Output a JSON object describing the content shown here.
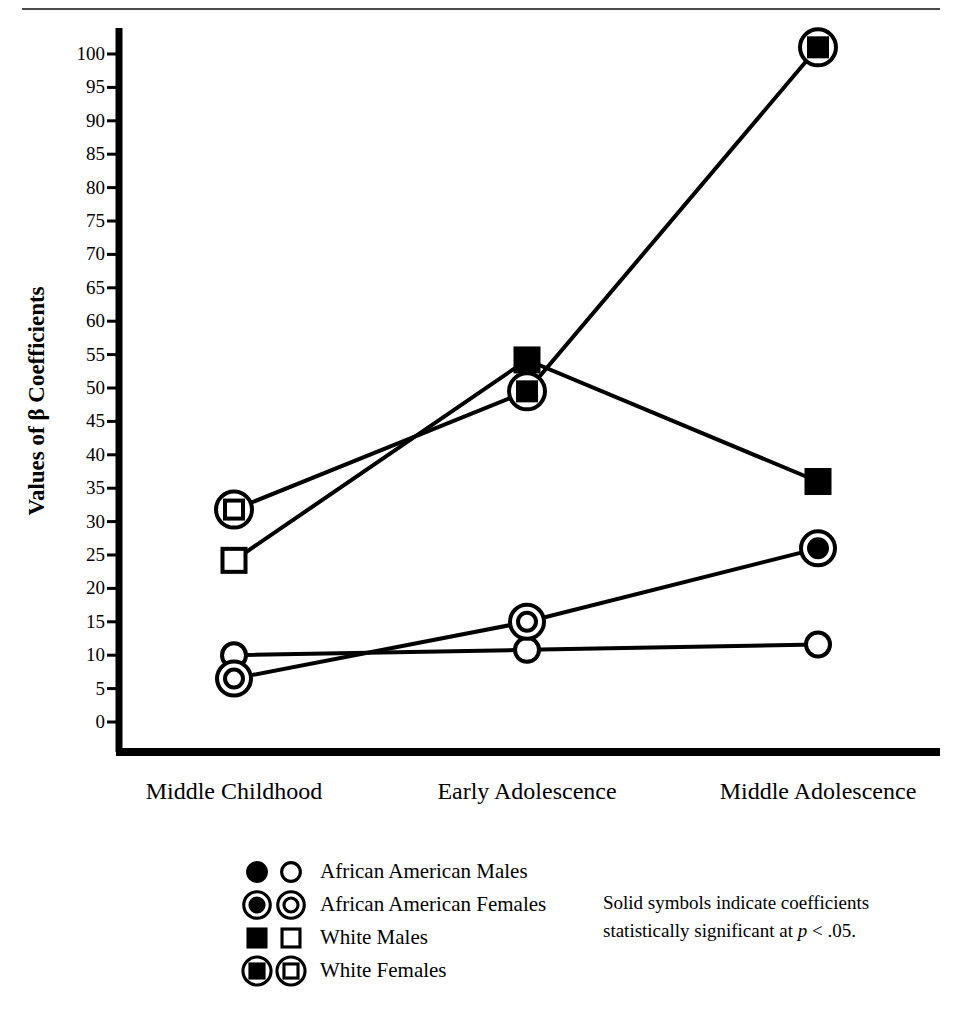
{
  "page": {
    "header_rule": true,
    "header_ghost_text": ""
  },
  "chart_data": {
    "type": "line",
    "title": "",
    "subtitle": "",
    "xlabel": "",
    "ylabel": "Values of β Coefficients",
    "categories": [
      "Middle Childhood",
      "Early Adolescence",
      "Middle Adolescence"
    ],
    "ylim": [
      0,
      100
    ],
    "ytick_step": 5,
    "yticks": [
      0,
      5,
      10,
      15,
      20,
      25,
      30,
      35,
      40,
      45,
      50,
      55,
      60,
      65,
      70,
      75,
      80,
      85,
      90,
      95,
      100
    ],
    "ytick_labels": [
      "0",
      "5",
      "10",
      "15",
      "20",
      "25",
      "30",
      "35",
      "40",
      "45",
      "50",
      "55",
      "60",
      "65",
      "70",
      "75",
      "80",
      "85",
      "90",
      "95",
      "100"
    ],
    "grid": false,
    "legend_position": "below-left",
    "series": [
      {
        "name": "African American Males",
        "marker": "circle",
        "values": [
          10.0,
          10.8,
          11.6
        ],
        "significant": [
          false,
          false,
          false
        ]
      },
      {
        "name": "African American Females",
        "marker": "circle-in-circle",
        "values": [
          6.5,
          15.0,
          26.0
        ],
        "significant": [
          false,
          false,
          true
        ]
      },
      {
        "name": "White Males",
        "marker": "square",
        "values": [
          24.2,
          54.2,
          36.0
        ],
        "significant": [
          false,
          true,
          true
        ]
      },
      {
        "name": "White Females",
        "marker": "square-in-circle",
        "values": [
          31.8,
          49.5,
          101.0
        ],
        "significant": [
          false,
          true,
          true
        ]
      }
    ],
    "annotations": [
      "Solid symbols indicate coefficients statistically significant at p < .05."
    ]
  },
  "legend": {
    "entries": [
      {
        "label": "African American Males",
        "marker": "circle"
      },
      {
        "label": "African American Females",
        "marker": "circle-in-circle"
      },
      {
        "label": "White Males",
        "marker": "square"
      },
      {
        "label": "White Females",
        "marker": "square-in-circle"
      }
    ]
  },
  "note": {
    "line1_pre": "Solid symbols indicate coefficients",
    "line2_pre": "statistically significant at ",
    "line2_ital": "p",
    "line2_post": " < .05."
  },
  "colors": {
    "ink": "#000000",
    "paper": "#ffffff",
    "rule": "#4a4a4a"
  }
}
